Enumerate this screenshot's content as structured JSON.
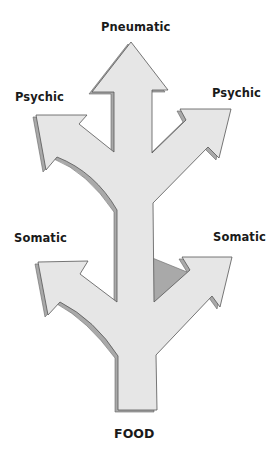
{
  "diagram": {
    "labels": {
      "top": "Pneumatic",
      "upper_left": "Psychic",
      "upper_right": "Psychic",
      "lower_left": "Somatic",
      "lower_right": "Somatic",
      "bottom": "FOOD"
    },
    "colors": {
      "fill": "#e6e6e6",
      "shadow": "#a9a9a9",
      "stroke": "#555555",
      "text": "#1a1a1a"
    }
  }
}
